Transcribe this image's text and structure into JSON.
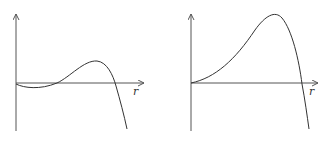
{
  "figure": {
    "panels": [
      {
        "name": "left-plot",
        "x_axis_label": "r",
        "description": "Curve starts at origin, dips slightly below axis, crosses, rises to a local maximum, then falls steeply below the axis"
      },
      {
        "name": "right-plot",
        "x_axis_label": "r",
        "description": "Curve starts at origin, rises to a high maximum, then falls steeply crossing the axis"
      }
    ]
  }
}
